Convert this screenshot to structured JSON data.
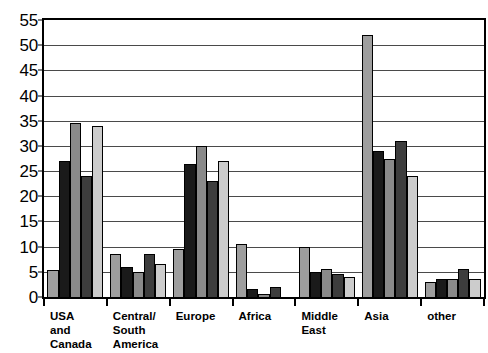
{
  "chart_data": {
    "type": "bar",
    "title": "",
    "subtitle": "",
    "xlabel": "",
    "ylabel": "",
    "ylim": [
      0,
      55
    ],
    "ytick_step": 5,
    "yticks": [
      0,
      5,
      10,
      15,
      20,
      25,
      30,
      35,
      40,
      45,
      50,
      55
    ],
    "ytick_labels": [
      "0",
      "5",
      "10",
      "15",
      "20",
      "25",
      "30",
      "35",
      "40",
      "45",
      "50",
      "55"
    ],
    "grid": true,
    "grid_axis": "y",
    "legend": false,
    "legend_position": "none",
    "grouping": "grouped",
    "categories": [
      "USA\nand\nCanada",
      "Central/\nSouth\nAmerica",
      "Europe",
      "Africa",
      "Middle\nEast",
      "Asia",
      "other"
    ],
    "series": [
      {
        "name": "series-1",
        "color": "#9e9e9e",
        "values": [
          5.3,
          8.5,
          9.5,
          10.5,
          10.0,
          52.0,
          3.0
        ]
      },
      {
        "name": "series-2",
        "color": "#1a1a1a",
        "values": [
          27.0,
          6.0,
          26.5,
          1.5,
          5.0,
          29.0,
          3.5
        ]
      },
      {
        "name": "series-3",
        "color": "#8a8a8a",
        "values": [
          34.5,
          5.0,
          30.0,
          0.5,
          5.5,
          27.5,
          3.5
        ]
      },
      {
        "name": "series-4",
        "color": "#3d3d3d",
        "values": [
          24.0,
          8.5,
          23.0,
          2.0,
          4.5,
          31.0,
          5.5
        ]
      },
      {
        "name": "series-5",
        "color": "#cccccc",
        "values": [
          34.0,
          6.5,
          27.0,
          0.0,
          4.0,
          24.0,
          3.5
        ]
      }
    ]
  },
  "axis_color": "#000000",
  "grid_color": "#4a4a4a",
  "background": "#ffffff"
}
